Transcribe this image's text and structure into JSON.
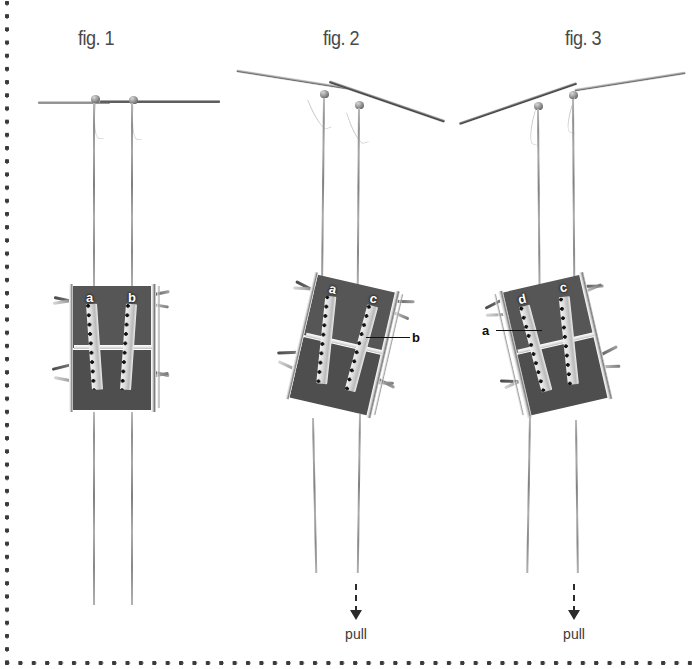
{
  "page": {
    "border_style": "dotted",
    "border_color": "#3a3a3a",
    "background": "#ffffff"
  },
  "figures": [
    {
      "id": "fig1",
      "caption": "fig. 1",
      "state": "rest",
      "rod_angle_deg": 0,
      "labels": [
        {
          "text": "a",
          "style": "white",
          "has_leader": false
        },
        {
          "text": "b",
          "style": "white",
          "has_leader": false
        }
      ],
      "pull": null
    },
    {
      "id": "fig2",
      "caption": "fig. 2",
      "state": "tilted-right-down",
      "rod_angle_deg": 19,
      "labels": [
        {
          "text": "a",
          "style": "white",
          "has_leader": false
        },
        {
          "text": "c",
          "style": "white",
          "has_leader": false
        },
        {
          "text": "b",
          "style": "black",
          "has_leader": true
        }
      ],
      "pull": {
        "label": "pull",
        "direction": "down"
      }
    },
    {
      "id": "fig3",
      "caption": "fig. 3",
      "state": "tilted-right-up",
      "rod_angle_deg": -19,
      "labels": [
        {
          "text": "d",
          "style": "white",
          "has_leader": false
        },
        {
          "text": "c",
          "style": "white",
          "has_leader": false
        },
        {
          "text": "a",
          "style": "black",
          "has_leader": true
        }
      ],
      "pull": {
        "label": "pull",
        "direction": "down"
      }
    }
  ],
  "colors": {
    "body": "#585858",
    "rail": "#e6e6e6",
    "dots": "#111111",
    "rod": "#7a7a7a",
    "string": "#9a9a9a",
    "label_white": "#ffffff",
    "label_black": "#0d0d0d",
    "caption": "#4a4a4a",
    "pull_arrow": "#2b2b2b"
  }
}
